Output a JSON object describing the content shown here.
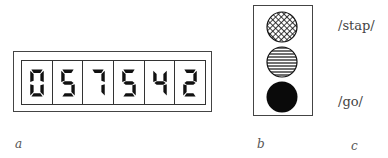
{
  "panel_a": {
    "display_digits": [
      "0",
      "5",
      "7",
      "5",
      "4",
      "2"
    ],
    "display_value": "057542",
    "caption": "a"
  },
  "panel_b": {
    "lights": [
      {
        "position": "top",
        "fill": "crosshatch"
      },
      {
        "position": "middle",
        "fill": "horizontal-stripes"
      },
      {
        "position": "bottom",
        "fill": "solid-black"
      }
    ],
    "caption": "b"
  },
  "panel_c": {
    "labels": [
      "/stap/",
      "/go/"
    ],
    "caption": "c"
  },
  "colors": {
    "ink": "#111111",
    "frame": "#444444",
    "background": "#ffffff"
  }
}
